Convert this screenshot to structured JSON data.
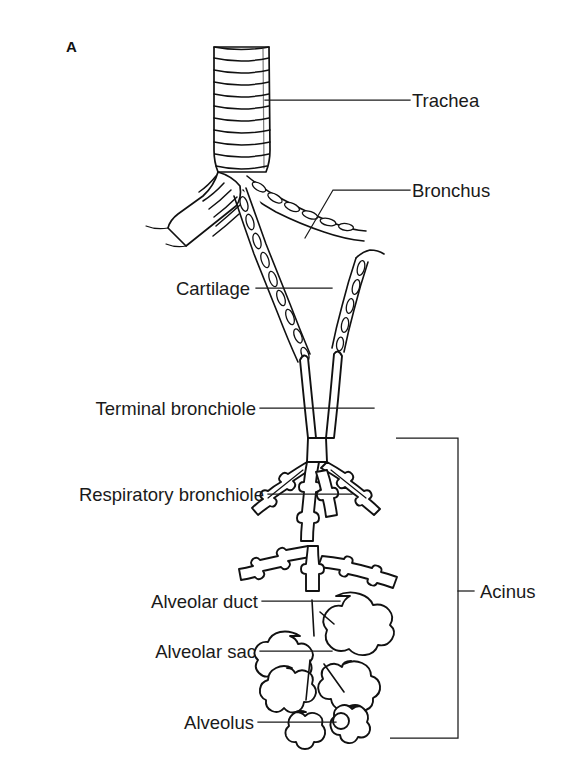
{
  "figure": {
    "panel_letter": "A",
    "background_color": "#ffffff",
    "line_color": "#111111",
    "text_color": "#1a1a1a"
  },
  "labels": {
    "trachea": "Trachea",
    "bronchus": "Bronchus",
    "cartilage": "Cartilage",
    "terminal_bronchiole": "Terminal bronchiole",
    "respiratory_bronchiole": "Respiratory bronchiole",
    "alveolar_duct": "Alveolar duct",
    "alveolar_sac": "Alveolar sac",
    "alveolus": "Alveolus",
    "acinus": "Acinus"
  },
  "annotations": [
    {
      "id": "trachea",
      "text": "Trachea",
      "side": "right",
      "text_x": 412,
      "text_y": 106,
      "leader": "M265,100 L410,100"
    },
    {
      "id": "bronchus",
      "text": "Bronchus",
      "side": "right",
      "text_x": 412,
      "text_y": 196,
      "leader": "M305,238 L333,190 L410,190"
    },
    {
      "id": "cartilage",
      "text": "Cartilage",
      "side": "left",
      "text_x": 250,
      "text_y": 294,
      "leader": "M256,288 L332,288"
    },
    {
      "id": "terminal-bronchiole",
      "text": "Terminal bronchiole",
      "side": "left",
      "text_x": 257,
      "text_y": 414,
      "leader": "M260,408 L374,408"
    },
    {
      "id": "respiratory-bronchiole",
      "text": "Respiratory bronchiole",
      "side": "left",
      "text_x": 265,
      "text_y": 500,
      "leader": "M268,494 L352,494"
    },
    {
      "id": "alveolar-duct",
      "text": "Alveolar duct",
      "side": "left",
      "text_x": 258,
      "text_y": 607,
      "leader": "M262,601 L340,601"
    },
    {
      "id": "alveolar-sac",
      "text": "Alveolar sac",
      "side": "left",
      "text_x": 256,
      "text_y": 657,
      "leader": "M260,651 L332,651"
    },
    {
      "id": "alveolus",
      "text": "Alveolus",
      "side": "left",
      "text_x": 254,
      "text_y": 728,
      "leader": "M258,722 L336,722"
    }
  ],
  "acinus_bracket": {
    "label": "Acinus",
    "text_x": 486,
    "text_y": 597,
    "path": "M396,438 L458,438 L458,738 L390,738",
    "tick": "M458,591 L474,591"
  },
  "structures": [
    {
      "id": "trachea",
      "name": "Trachea",
      "cartilage_rings": 11,
      "note": "C-shaped hyaline cartilage rings"
    },
    {
      "id": "main-bronchi",
      "name": "Bronchus",
      "note": "paired, walls studded with cartilage plates"
    },
    {
      "id": "cartilage-plates",
      "name": "Cartilage",
      "note": "irregular plates in bronchial wall"
    },
    {
      "id": "terminal-bronchiole",
      "name": "Terminal bronchiole",
      "note": "no cartilage, last purely conducting airway"
    },
    {
      "id": "respiratory-bronchiole",
      "name": "Respiratory bronchiole",
      "note": "scattered alveolar outpouchings"
    },
    {
      "id": "alveolar-duct",
      "name": "Alveolar duct",
      "note": "corridor lined entirely by alveoli"
    },
    {
      "id": "alveolar-sac",
      "name": "Alveolar sac",
      "note": "terminal cluster of alveoli"
    },
    {
      "id": "alveolus",
      "name": "Alveolus",
      "note": "single gas-exchange air space"
    },
    {
      "id": "acinus",
      "name": "Acinus",
      "note": "respiratory bronchiole through alveolar sacs"
    }
  ]
}
